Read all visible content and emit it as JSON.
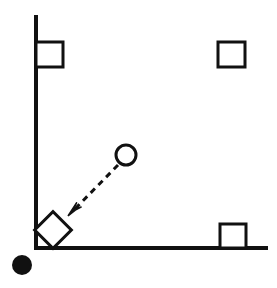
{
  "canvas": {
    "width": 277,
    "height": 288,
    "background_color": "#ffffff",
    "stroke_color": "#111111",
    "fill_color": "#111111"
  },
  "axes": {
    "vertical_axis": {
      "label": "vertical-axis-line",
      "x": 36,
      "y_top": 17,
      "y_bottom": 248,
      "stroke_width": 4
    },
    "horizontal_axis": {
      "label": "horizontal-axis-line",
      "y": 248,
      "x_left": 36,
      "x_right": 266,
      "stroke_width": 4
    }
  },
  "shapes": [
    {
      "id": "square-top-left",
      "type": "square",
      "style": "outline",
      "x": 36,
      "y": 42,
      "width": 27,
      "height": 25,
      "stroke_width": 3,
      "note": "overlaps the vertical axis line on its left edge"
    },
    {
      "id": "square-top-right",
      "type": "square",
      "style": "outline",
      "x": 218,
      "y": 42,
      "width": 27,
      "height": 25,
      "stroke_width": 3,
      "note": "free standing near top right"
    },
    {
      "id": "square-bottom-right",
      "type": "square",
      "style": "outline",
      "x": 220,
      "y": 224,
      "width": 26,
      "height": 24,
      "stroke_width": 3,
      "note": "rests on the horizontal axis line"
    },
    {
      "id": "rotated-square-corner",
      "type": "square",
      "style": "outline-rotated",
      "center_x": 53,
      "center_y": 230,
      "side": 26,
      "rotation_degrees": 45,
      "stroke_width": 3,
      "note": "diamond orientation tucked into the corner of the axes"
    },
    {
      "id": "circle-open",
      "type": "circle",
      "style": "outline",
      "center_x": 126,
      "center_y": 155,
      "radius": 10,
      "stroke_width": 3
    },
    {
      "id": "circle-filled",
      "type": "circle",
      "style": "filled",
      "center_x": 22,
      "center_y": 265,
      "radius": 10,
      "stroke_width": 0,
      "note": "solid black dot outside the corner, below and left of the origin"
    }
  ],
  "arrow": {
    "id": "dashed-arrow",
    "type": "dashed-line-with-arrowhead",
    "from_x": 118,
    "from_y": 165,
    "to_x": 68,
    "to_y": 216,
    "stroke_width": 3,
    "dash_pattern": "6 5",
    "arrowhead_size": 11,
    "points_from": "circle-open",
    "points_to": "rotated-square-corner"
  }
}
